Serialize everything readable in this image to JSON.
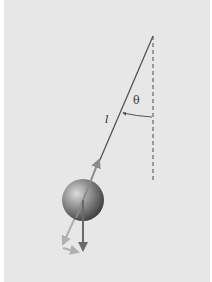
{
  "diagram": {
    "type": "simple pendulum free-body diagram",
    "labels": {
      "length": "l",
      "angle": "θ"
    },
    "colors": {
      "background": "#e7e7e7",
      "string": "#555555",
      "dashed_vertical": "#666666",
      "ball_light": "#d8d8d8",
      "ball_dark": "#3a3a3a",
      "tension_arrow": "#8a8a8a",
      "weight_arrow": "#6a6a6a",
      "component_arrows": "#b0b0b0"
    },
    "elements": [
      {
        "name": "pivot",
        "x": 153,
        "y": 36
      },
      {
        "name": "string",
        "from": [
          153,
          36
        ],
        "to": [
          83,
          200
        ]
      },
      {
        "name": "vertical-reference",
        "style": "dashed",
        "from": [
          153,
          36
        ],
        "to": [
          153,
          183
        ]
      },
      {
        "name": "angle-arc",
        "label": "θ"
      },
      {
        "name": "bob",
        "cx": 83,
        "cy": 200,
        "r": 21
      },
      {
        "name": "tension-vector",
        "direction": "along string toward pivot"
      },
      {
        "name": "weight-vector",
        "direction": "vertically down"
      },
      {
        "name": "weight-component-along-string"
      },
      {
        "name": "weight-component-perpendicular"
      }
    ]
  }
}
